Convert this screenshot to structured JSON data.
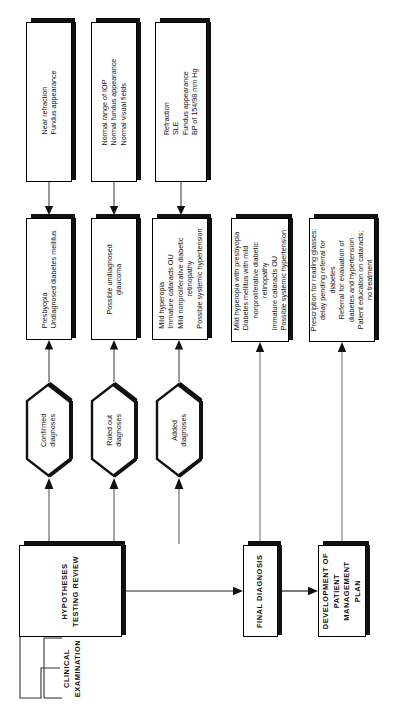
{
  "diagram": {
    "orientation": "rotated-90-ccw",
    "colors": {
      "ink": "#111111",
      "background": "#ffffff",
      "shadow": "#111111"
    }
  },
  "findings_boxes": [
    {
      "id": "findings-near-refraction",
      "lines": [
        "Near refraction",
        "Fundus appearance"
      ]
    },
    {
      "id": "findings-iop",
      "lines": [
        "Normal range of IOP",
        "Normal fundus appearance",
        "Normal visual fields"
      ]
    },
    {
      "id": "findings-refraction-sle",
      "lines": [
        "Refraction",
        "SLE",
        "Fundus appearance",
        "BP of 154/98 mm Hg"
      ]
    }
  ],
  "diagnosis_boxes": [
    {
      "id": "confirmed-diagnoses-detail",
      "lines": [
        "Presbyopia",
        "Undiagnosed diabetes mellitus"
      ]
    },
    {
      "id": "ruled-out-diagnoses-detail",
      "lines": [
        "Possible undiagnosed",
        "glaucoma"
      ]
    },
    {
      "id": "added-diagnoses-detail",
      "lines": [
        "Mild hyperopia",
        "Immature cataracts OU",
        "Mild nonproliferative diabetic",
        "retinopathy",
        "Possible systemic hypertension"
      ]
    }
  ],
  "final_diagnosis_detail": {
    "id": "final-diagnosis-detail",
    "lines": [
      "Mild hyperopia with presbyopia",
      "Diabetes mellitus with mild",
      "nonproliferative diabetic",
      "retinopathy",
      "Immature cataracts OU",
      "Possible systemic hypertension"
    ]
  },
  "management_plan_detail": {
    "id": "management-plan-detail",
    "lines": [
      "Prescription for reading glasses;",
      "delay pending referral for",
      "diabetes",
      "Referral for evaluation of",
      "diabetes and hypertension",
      "Patient education on cataracts;",
      "no treatment"
    ]
  },
  "hexagons": [
    {
      "id": "hex-confirmed",
      "lines": [
        "Confirmed",
        "diagnoses"
      ]
    },
    {
      "id": "hex-ruled-out",
      "lines": [
        "Ruled out",
        "diagnoses"
      ]
    },
    {
      "id": "hex-added",
      "lines": [
        "Added",
        "diagnoses"
      ]
    }
  ],
  "process_boxes": {
    "hypotheses": {
      "id": "hypotheses-testing-review",
      "lines": [
        "HYPOTHESES",
        "TESTING REVIEW"
      ]
    },
    "final_diagnosis": {
      "id": "final-diagnosis",
      "lines": [
        "FINAL DIAGNOSIS"
      ]
    },
    "management_plan": {
      "id": "development-of-patient-management-plan",
      "lines": [
        "DEVELOPMENT OF",
        "PATIENT",
        "MANAGEMENT",
        "PLAN"
      ]
    }
  },
  "bracket": {
    "id": "clinical-examination-bracket",
    "lines": [
      "CLINICAL",
      "EXAMINATION"
    ]
  }
}
